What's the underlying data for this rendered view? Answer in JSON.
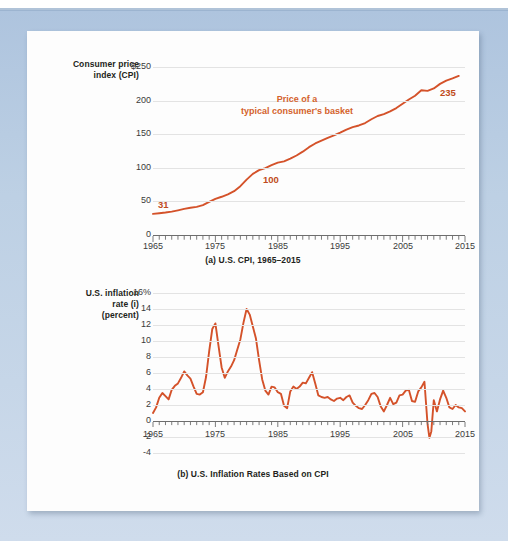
{
  "page": {
    "background_color": "#bdd0e4",
    "paper_color": "#fdfdfd",
    "accent_color": "#d4522a",
    "grid_color": "#e3e3e3"
  },
  "chart_data": [
    {
      "type": "line",
      "id": "cpi",
      "title": "(a) U.S. CPI, 1965–2015",
      "ylabel": "Consumer price index (CPI)",
      "ylabel_lines": [
        "Consumer price",
        "index (CPI)"
      ],
      "xlabel": "",
      "xlim": [
        1965,
        2015
      ],
      "ylim": [
        0,
        250
      ],
      "yticks": [
        "0",
        "50",
        "100",
        "150",
        "200",
        "$250"
      ],
      "ytick_values": [
        0,
        50,
        100,
        150,
        200,
        250
      ],
      "xticks": [
        "1965",
        "1975",
        "1985",
        "1995",
        "2005",
        "2015"
      ],
      "xtick_values": [
        1965,
        1975,
        1985,
        1995,
        2005,
        2015
      ],
      "grid": true,
      "minor_xtick_interval": 1,
      "annotations": [
        {
          "text": "Price of a",
          "text2": "typical consumer's basket",
          "x": 1987,
          "y": 205
        },
        {
          "text": "31",
          "x": 1965,
          "y": 31,
          "kind": "data-label"
        },
        {
          "text": "100",
          "x": 1983,
          "y": 100,
          "kind": "data-label"
        },
        {
          "text": "235",
          "x": 2014,
          "y": 235,
          "kind": "data-label"
        }
      ],
      "series": [
        {
          "name": "U.S. CPI",
          "color": "#d4522a",
          "x": [
            1965,
            1966,
            1967,
            1968,
            1969,
            1970,
            1971,
            1972,
            1973,
            1974,
            1975,
            1976,
            1977,
            1978,
            1979,
            1980,
            1981,
            1982,
            1983,
            1984,
            1985,
            1986,
            1987,
            1988,
            1989,
            1990,
            1991,
            1992,
            1993,
            1994,
            1995,
            1996,
            1997,
            1998,
            1999,
            2000,
            2001,
            2002,
            2003,
            2004,
            2005,
            2006,
            2007,
            2008,
            2009,
            2010,
            2011,
            2012,
            2013,
            2014
          ],
          "values": [
            31.5,
            32.4,
            33.4,
            34.8,
            36.7,
            38.8,
            40.5,
            41.8,
            44.4,
            49.3,
            53.8,
            56.9,
            60.6,
            65.2,
            72.6,
            82.4,
            90.9,
            96.5,
            99.6,
            103.9,
            107.6,
            109.6,
            113.6,
            118.3,
            124.0,
            130.7,
            136.2,
            140.3,
            144.5,
            148.2,
            152.4,
            156.9,
            160.5,
            163.0,
            166.6,
            172.2,
            177.1,
            179.9,
            184.0,
            188.9,
            195.3,
            201.6,
            207.3,
            215.3,
            214.5,
            218.1,
            224.9,
            229.6,
            233.0,
            236.7
          ]
        }
      ]
    },
    {
      "type": "line",
      "id": "inflation",
      "title": "(b) U.S. Inflation Rates Based on CPI",
      "ylabel": "U.S. inflation rate (i) (percent)",
      "ylabel_lines": [
        "U.S. inflation",
        "rate (i)",
        "(percent)"
      ],
      "xlabel": "",
      "xlim": [
        1965,
        2015
      ],
      "ylim": [
        -4,
        16
      ],
      "yticks": [
        "-4",
        "-2",
        "0",
        "2",
        "4",
        "6",
        "8",
        "10",
        "12",
        "14",
        "16%"
      ],
      "ytick_values": [
        -4,
        -2,
        0,
        2,
        4,
        6,
        8,
        10,
        12,
        14,
        16
      ],
      "xticks": [
        "1965",
        "1975",
        "1985",
        "1995",
        "2005",
        "2015"
      ],
      "xtick_values": [
        1965,
        1975,
        1985,
        1995,
        2005,
        2015
      ],
      "grid": true,
      "minor_xtick_interval": 1,
      "series": [
        {
          "name": "U.S. inflation rate",
          "color": "#d4522a",
          "x": [
            1965.0,
            1965.5,
            1966.0,
            1966.5,
            1967.0,
            1967.5,
            1968.0,
            1968.5,
            1969.0,
            1969.5,
            1970.0,
            1970.5,
            1971.0,
            1971.5,
            1972.0,
            1972.5,
            1973.0,
            1973.5,
            1974.0,
            1974.5,
            1975.0,
            1975.5,
            1976.0,
            1976.5,
            1977.0,
            1977.5,
            1978.0,
            1978.5,
            1979.0,
            1979.5,
            1980.0,
            1980.5,
            1981.0,
            1981.5,
            1982.0,
            1982.5,
            1983.0,
            1983.5,
            1984.0,
            1984.5,
            1985.0,
            1985.5,
            1986.0,
            1986.5,
            1987.0,
            1987.5,
            1988.0,
            1988.5,
            1989.0,
            1989.5,
            1990.0,
            1990.5,
            1991.0,
            1991.5,
            1992.0,
            1992.5,
            1993.0,
            1993.5,
            1994.0,
            1994.5,
            1995.0,
            1995.5,
            1996.0,
            1996.5,
            1997.0,
            1997.5,
            1998.0,
            1998.5,
            1999.0,
            1999.5,
            2000.0,
            2000.5,
            2001.0,
            2001.5,
            2002.0,
            2002.5,
            2003.0,
            2003.5,
            2004.0,
            2004.5,
            2005.0,
            2005.5,
            2006.0,
            2006.5,
            2007.0,
            2007.5,
            2008.0,
            2008.5,
            2009.0,
            2009.3,
            2009.6,
            2010.0,
            2010.5,
            2011.0,
            2011.5,
            2012.0,
            2012.5,
            2013.0,
            2013.5,
            2014.0,
            2014.5,
            2015.0
          ],
          "values": [
            1.0,
            1.7,
            2.9,
            3.5,
            3.1,
            2.7,
            3.9,
            4.4,
            4.7,
            5.4,
            6.2,
            5.7,
            5.3,
            4.3,
            3.4,
            3.3,
            3.6,
            5.5,
            8.7,
            11.5,
            12.2,
            9.4,
            6.7,
            5.4,
            6.2,
            6.8,
            7.6,
            8.9,
            10.2,
            12.3,
            14.0,
            13.3,
            11.8,
            10.3,
            7.6,
            5.2,
            3.8,
            3.3,
            4.3,
            4.2,
            3.6,
            3.4,
            1.9,
            1.6,
            3.7,
            4.3,
            4.0,
            4.3,
            4.8,
            4.7,
            5.4,
            6.1,
            4.7,
            3.2,
            3.0,
            2.9,
            3.0,
            2.7,
            2.5,
            2.8,
            2.9,
            2.6,
            3.0,
            3.2,
            2.3,
            1.9,
            1.6,
            1.5,
            2.0,
            2.6,
            3.4,
            3.5,
            3.0,
            1.8,
            1.2,
            2.0,
            2.9,
            2.1,
            2.3,
            3.2,
            3.3,
            3.8,
            3.9,
            2.5,
            2.4,
            3.7,
            4.2,
            4.9,
            -0.4,
            -2.1,
            -1.3,
            2.6,
            1.2,
            2.7,
            3.8,
            2.9,
            1.7,
            1.5,
            2.0,
            1.7,
            1.6,
            1.2
          ]
        }
      ]
    }
  ]
}
